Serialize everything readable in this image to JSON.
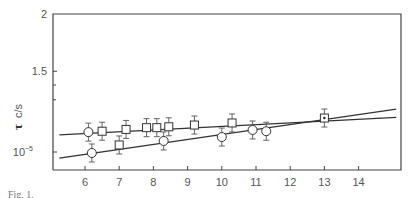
{
  "chart_data": {
    "type": "scatter",
    "title": "",
    "caption": "Fig. 1.",
    "xlabel": "",
    "ylabel": "τ c/s",
    "ylabel_symbol": "τ",
    "ylabel_units": "c/s",
    "xlim": [
      5.0,
      15.2
    ],
    "ylim": [
      0.95,
      2.0
    ],
    "yscale": "log",
    "x_ticks": [
      6,
      7,
      8,
      9,
      10,
      11,
      12,
      13,
      14
    ],
    "x_tick_labels": [
      "6",
      "7",
      "8",
      "9",
      "10",
      "11",
      "12",
      "13",
      "14"
    ],
    "y_ticks": [
      1.0,
      1.5,
      2.0
    ],
    "y_tick_labels": [
      "10⁻⁵",
      "1.5",
      "2"
    ],
    "y_minor_ticks": [
      1.4,
      1.3
    ],
    "grid": false,
    "legend": "none",
    "series": [
      {
        "name": "squares",
        "marker": "square",
        "points": [
          {
            "x": 6.5,
            "y": 1.11
          },
          {
            "x": 7.0,
            "y": 1.036
          },
          {
            "x": 7.2,
            "y": 1.12
          },
          {
            "x": 7.8,
            "y": 1.13
          },
          {
            "x": 8.1,
            "y": 1.13
          },
          {
            "x": 8.45,
            "y": 1.135
          },
          {
            "x": 9.2,
            "y": 1.145
          },
          {
            "x": 10.3,
            "y": 1.157
          },
          {
            "x": 13.0,
            "y": 1.186
          }
        ],
        "error": 0.03
      },
      {
        "name": "circles",
        "marker": "circle",
        "points": [
          {
            "x": 6.1,
            "y": 1.105
          },
          {
            "x": 6.2,
            "y": 0.995
          },
          {
            "x": 8.3,
            "y": 1.057
          },
          {
            "x": 10.0,
            "y": 1.078
          },
          {
            "x": 10.9,
            "y": 1.117
          },
          {
            "x": 11.3,
            "y": 1.11
          }
        ],
        "error": 0.03
      }
    ],
    "fit_lines": [
      {
        "name": "upper-fit",
        "x": [
          5.25,
          15.1
        ],
        "y": [
          1.09,
          1.19
        ]
      },
      {
        "name": "lower-fit",
        "x": [
          5.25,
          15.1
        ],
        "y": [
          0.97,
          1.24
        ]
      }
    ],
    "combined_point": {
      "x": 13.0,
      "y": 1.186,
      "marker": "square-with-dot"
    }
  }
}
